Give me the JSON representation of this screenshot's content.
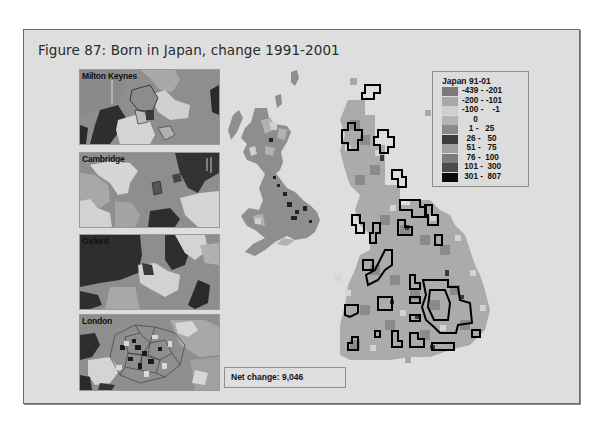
{
  "figure": {
    "title": "Figure 87: Born in Japan, change 1991-2001"
  },
  "insets": [
    {
      "name": "Milton Keynes",
      "top": 69
    },
    {
      "name": "Cambridge",
      "top": 152
    },
    {
      "name": "Oxford",
      "top": 234
    },
    {
      "name": "London",
      "top": 314
    }
  ],
  "legend": {
    "title": "Japan 91-01",
    "classes": [
      {
        "label": "-439 - -201",
        "color": "#7a7a7a"
      },
      {
        "label": "-200 - -101",
        "color": "#a8a8a8"
      },
      {
        "label": "-100 -    -1",
        "color": "#cfcfcf"
      },
      {
        "label": "     0",
        "color": "#b4b4b4"
      },
      {
        "label": "   1 -   25",
        "color": "#8a8a8a"
      },
      {
        "label": "  26 -   50",
        "color": "#3c3c3c"
      },
      {
        "label": "  51 -   75",
        "color": "#a0a0a0"
      },
      {
        "label": "  76 -  100",
        "color": "#7c7c7c"
      },
      {
        "label": " 101 -  300",
        "color": "#4a4a4a"
      },
      {
        "label": " 301 -  807",
        "color": "#0a0a0a"
      }
    ]
  },
  "summary": {
    "net_change_label": "Net change: 9,046"
  }
}
